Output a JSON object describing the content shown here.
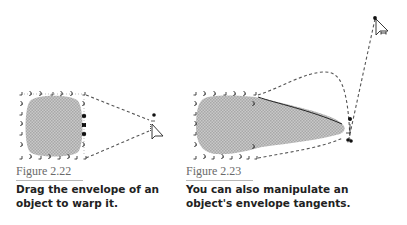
{
  "figures": [
    {
      "id": "2.22",
      "label": "Figure 2.22",
      "caption": "Drag the envelope of an object to warp it."
    },
    {
      "id": "2.23",
      "label": "Figure 2.23",
      "caption": "You can also manipulate an object's envelope tangents."
    }
  ],
  "colors": {
    "fill": "#bdbdbd",
    "handle": "#222222",
    "dash": "#555555",
    "label": "#6a6a6a",
    "rule": "#b8b8b8",
    "caption": "#222222"
  }
}
